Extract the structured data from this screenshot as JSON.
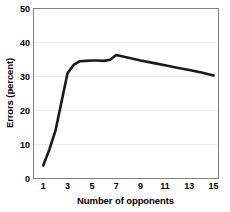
{
  "chart_data": {
    "type": "line",
    "title": "",
    "xlabel": "Number of opponents",
    "ylabel": "Errors (percent)",
    "xlim": [
      0.2,
      15.4
    ],
    "ylim": [
      0,
      50
    ],
    "xticks": [
      1,
      3,
      5,
      7,
      9,
      11,
      13,
      15
    ],
    "yticks": [
      0,
      10,
      20,
      30,
      40,
      50
    ],
    "xtick_labels": [
      "1",
      "3",
      "5",
      "7",
      "9",
      "11",
      "13",
      "15"
    ],
    "ytick_labels": [
      "0",
      "10",
      "20",
      "30",
      "40",
      "50"
    ],
    "grid": "horizontal",
    "grid_color": "#e9e9e9",
    "line_color": "#1a1a1a",
    "line_width": 2.6,
    "background": "#ffffff",
    "frame_color": "#808080",
    "series": [
      {
        "name": "Errors",
        "x": [
          1,
          1.5,
          2,
          2.5,
          3,
          3.5,
          4,
          4.5,
          5,
          5.5,
          6,
          6.5,
          7,
          8,
          9,
          10,
          11,
          12,
          13,
          14,
          15
        ],
        "values": [
          3.8,
          8.5,
          14.0,
          22.5,
          31.0,
          33.4,
          34.5,
          34.6,
          34.7,
          34.7,
          34.6,
          34.9,
          36.3,
          35.5,
          34.7,
          34.0,
          33.3,
          32.6,
          31.9,
          31.2,
          30.3
        ]
      }
    ],
    "key_points": {
      "start": {
        "x": 1,
        "y": 3.8
      },
      "knee": {
        "x": 3,
        "y": 31.0
      },
      "plateau": {
        "x": 5,
        "y": 34.7
      },
      "peak": {
        "x": 7,
        "y": 36.3
      },
      "end": {
        "x": 15,
        "y": 30.3
      }
    }
  }
}
